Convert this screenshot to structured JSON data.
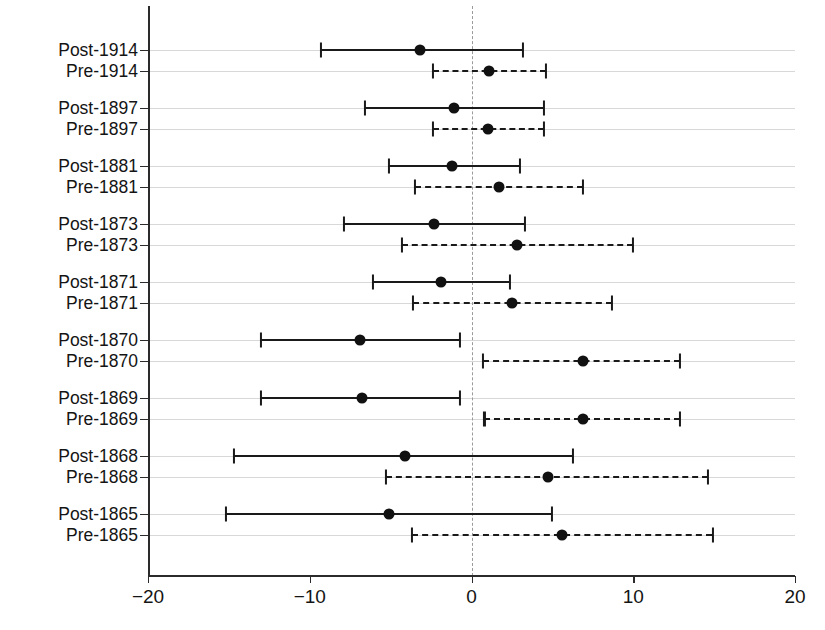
{
  "chart_data": {
    "type": "scatter",
    "title": "",
    "xlabel": "",
    "ylabel": "",
    "xlim": [
      -20,
      20
    ],
    "xticks": [
      -20,
      -10,
      0,
      10,
      20
    ],
    "xticklabels": [
      "−20",
      "−10",
      "0",
      "10",
      "20"
    ],
    "grid": true,
    "zero_reference_line": 0,
    "legend": [],
    "categories": [
      "Post-1914",
      "Pre-1914",
      "Post-1897",
      "Pre-1897",
      "Post-1881",
      "Pre-1881",
      "Post-1873",
      "Pre-1873",
      "Post-1871",
      "Pre-1871",
      "Post-1870",
      "Pre-1870",
      "Post-1869",
      "Pre-1869",
      "Post-1868",
      "Pre-1868",
      "Post-1865",
      "Pre-1865"
    ],
    "series": [
      {
        "name": "Post (solid)",
        "line_style": "solid",
        "points": [
          {
            "category": "Post-1914",
            "estimate": -3.2,
            "ci_low": -9.3,
            "ci_high": 3.2
          },
          {
            "category": "Post-1897",
            "estimate": -1.1,
            "ci_low": -6.6,
            "ci_high": 4.5
          },
          {
            "category": "Post-1881",
            "estimate": -1.2,
            "ci_low": -5.1,
            "ci_high": 3.0
          },
          {
            "category": "Post-1873",
            "estimate": -2.3,
            "ci_low": -7.9,
            "ci_high": 3.3
          },
          {
            "category": "Post-1871",
            "estimate": -1.9,
            "ci_low": -6.1,
            "ci_high": 2.4
          },
          {
            "category": "Post-1870",
            "estimate": -6.9,
            "ci_low": -13.0,
            "ci_high": -0.7
          },
          {
            "category": "Post-1869",
            "estimate": -6.8,
            "ci_low": -13.0,
            "ci_high": -0.7
          },
          {
            "category": "Post-1868",
            "estimate": -4.1,
            "ci_low": -14.7,
            "ci_high": 6.3
          },
          {
            "category": "Post-1865",
            "estimate": -5.1,
            "ci_low": -15.2,
            "ci_high": 5.0
          }
        ]
      },
      {
        "name": "Pre (dashed)",
        "line_style": "dashed",
        "points": [
          {
            "category": "Pre-1914",
            "estimate": 1.1,
            "ci_low": -2.4,
            "ci_high": 4.6
          },
          {
            "category": "Pre-1897",
            "estimate": 1.0,
            "ci_low": -2.4,
            "ci_high": 4.5
          },
          {
            "category": "Pre-1881",
            "estimate": 1.7,
            "ci_low": -3.5,
            "ci_high": 6.9
          },
          {
            "category": "Pre-1873",
            "estimate": 2.8,
            "ci_low": -4.3,
            "ci_high": 10.0
          },
          {
            "category": "Pre-1871",
            "estimate": 2.5,
            "ci_low": -3.6,
            "ci_high": 8.7
          },
          {
            "category": "Pre-1870",
            "estimate": 6.9,
            "ci_low": 0.7,
            "ci_high": 12.9
          },
          {
            "category": "Pre-1869",
            "estimate": 6.9,
            "ci_low": 0.8,
            "ci_high": 12.9
          },
          {
            "category": "Pre-1868",
            "estimate": 4.7,
            "ci_low": -5.3,
            "ci_high": 14.6
          },
          {
            "category": "Pre-1865",
            "estimate": 5.6,
            "ci_low": -3.7,
            "ci_high": 14.9
          }
        ]
      }
    ]
  },
  "colors": {
    "point": "#111111",
    "line": "#1a1a1a",
    "grid": "#d8d8d8",
    "axis": "#2b2b2b",
    "zero_line": "#9a9a9a",
    "background": "#ffffff"
  }
}
